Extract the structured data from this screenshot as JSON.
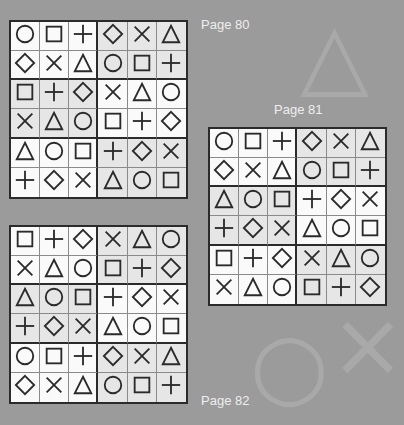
{
  "symbols": {
    "O": "circle-icon",
    "S": "square-icon",
    "P": "plus-icon",
    "D": "diamond-icon",
    "X": "cross-icon",
    "T": "triangle-icon"
  },
  "colors": {
    "background": "#9b9b9b",
    "cell_white": "#fafafa",
    "cell_shaded": "#e6e6e6",
    "border": "#2b2b2b",
    "label": "#eeeeee"
  },
  "puzzles": [
    {
      "label": "Page 80",
      "grid": [
        [
          "O",
          "S",
          "P",
          "D",
          "X",
          "T"
        ],
        [
          "D",
          "X",
          "T",
          "O",
          "S",
          "P"
        ],
        [
          "S",
          "P",
          "D",
          "X",
          "T",
          "O"
        ],
        [
          "X",
          "T",
          "O",
          "S",
          "P",
          "D"
        ],
        [
          "T",
          "O",
          "S",
          "P",
          "D",
          "X"
        ],
        [
          "P",
          "D",
          "X",
          "T",
          "O",
          "S"
        ]
      ]
    },
    {
      "label": "Page 81",
      "grid": [
        [
          "O",
          "S",
          "P",
          "D",
          "X",
          "T"
        ],
        [
          "D",
          "X",
          "T",
          "O",
          "S",
          "P"
        ],
        [
          "T",
          "O",
          "S",
          "P",
          "D",
          "X"
        ],
        [
          "P",
          "D",
          "X",
          "T",
          "O",
          "S"
        ],
        [
          "S",
          "P",
          "D",
          "X",
          "T",
          "O"
        ],
        [
          "X",
          "T",
          "O",
          "S",
          "P",
          "D"
        ]
      ]
    },
    {
      "label": "Page 82",
      "grid": [
        [
          "S",
          "P",
          "D",
          "X",
          "T",
          "O"
        ],
        [
          "X",
          "T",
          "O",
          "S",
          "P",
          "D"
        ],
        [
          "T",
          "O",
          "S",
          "P",
          "D",
          "X"
        ],
        [
          "P",
          "D",
          "X",
          "T",
          "O",
          "S"
        ],
        [
          "O",
          "S",
          "P",
          "D",
          "X",
          "T"
        ],
        [
          "D",
          "X",
          "T",
          "O",
          "S",
          "P"
        ]
      ]
    }
  ]
}
